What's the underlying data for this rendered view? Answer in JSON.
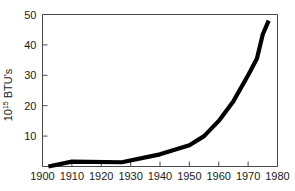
{
  "chart_data": {
    "type": "line",
    "title": "",
    "subtitle": "",
    "xlabel": "",
    "ylabel": "10¹⁵ BTU's",
    "ylabel_base": "10",
    "ylabel_exponent": "15",
    "ylabel_suffix": " BTU's",
    "xlim": [
      1900,
      1980
    ],
    "ylim": [
      0,
      50
    ],
    "grid": false,
    "legend": false,
    "legend_position": "none",
    "line_color": "#000000",
    "axis_color": "#4a4a4a",
    "x_ticks": [
      1900,
      1910,
      1920,
      1930,
      1940,
      1950,
      1960,
      1970,
      1980
    ],
    "x_tick_labels": [
      "1900",
      "1910",
      "1920",
      "1930",
      "1940",
      "1950",
      "1960",
      "1970",
      "1980"
    ],
    "y_ticks": [
      10,
      20,
      30,
      40,
      50
    ],
    "y_tick_labels": [
      "10",
      "20",
      "30",
      "40",
      "50"
    ],
    "series": [
      {
        "name": "Energy consumption",
        "x": [
          1902,
          1910,
          1927,
          1940,
          1950,
          1955,
          1960,
          1965,
          1970,
          1973,
          1975,
          1977
        ],
        "values": [
          0.0,
          1.6,
          1.4,
          4.0,
          7.0,
          10.0,
          15.0,
          21.5,
          30.0,
          35.5,
          43.5,
          48.0
        ]
      }
    ]
  }
}
